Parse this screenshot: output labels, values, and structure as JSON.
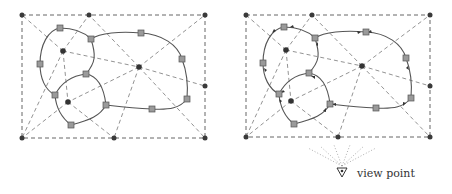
{
  "figure": {
    "panels": [
      {
        "id": "left",
        "description": "Subdivision of a rectangle into cells around interior sites; closed curves with square control points",
        "boundary_points": [
          [
            22,
            15
          ],
          [
            89,
            15
          ],
          [
            205,
            15
          ],
          [
            205,
            86
          ],
          [
            22,
            138
          ],
          [
            114,
            138
          ],
          [
            205,
            138
          ]
        ],
        "sites": [
          [
            63,
            51
          ],
          [
            139,
            67
          ],
          [
            68,
            102
          ]
        ],
        "squares": [
          [
            60,
            28
          ],
          [
            91,
            39
          ],
          [
            141,
            33
          ],
          [
            182,
            59
          ],
          [
            40,
            64
          ],
          [
            86,
            74
          ],
          [
            55,
            95
          ],
          [
            106,
            105
          ],
          [
            187,
            99
          ],
          [
            152,
            109
          ],
          [
            71,
            125
          ]
        ],
        "directed": false
      },
      {
        "id": "right",
        "description": "Same subdivision with oriented curve edges (arrows) as seen from the view point",
        "boundary_points": [
          [
            246,
            15
          ],
          [
            312,
            15
          ],
          [
            430,
            15
          ],
          [
            430,
            86
          ],
          [
            246,
            137
          ],
          [
            338,
            137
          ],
          [
            430,
            137
          ]
        ],
        "sites": [
          [
            286,
            50
          ],
          [
            362,
            66
          ],
          [
            291,
            101
          ]
        ],
        "squares": [
          [
            284,
            27
          ],
          [
            315,
            38
          ],
          [
            366,
            32
          ],
          [
            406,
            58
          ],
          [
            263,
            63
          ],
          [
            309,
            73
          ],
          [
            279,
            94
          ],
          [
            330,
            104
          ],
          [
            411,
            98
          ],
          [
            376,
            108
          ],
          [
            294,
            124
          ]
        ],
        "directed": true
      }
    ],
    "view_point": {
      "label": "view point",
      "position": [
        342,
        173
      ]
    }
  }
}
